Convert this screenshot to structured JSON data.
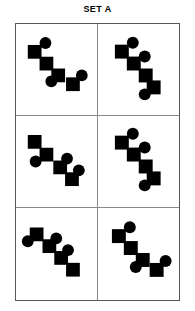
{
  "title": "SET A",
  "colors": {
    "shape_fill": "#000000",
    "background": "#ffffff",
    "outer_border": "#58585a",
    "inner_border": "#8a8a8c"
  },
  "grid": {
    "columns": 2,
    "rows": 3
  },
  "cells": [
    {
      "id": "cell-1",
      "label": "Figure 1",
      "squares": [
        {
          "x": 12,
          "y": 14,
          "size": 14
        },
        {
          "x": 24,
          "y": 26,
          "size": 14
        },
        {
          "x": 36,
          "y": 38,
          "size": 14
        },
        {
          "x": 51,
          "y": 47,
          "size": 14
        }
      ],
      "circles": [
        {
          "cx": 30,
          "cy": 12,
          "r": 6
        },
        {
          "cx": 36,
          "cy": 51,
          "r": 6
        },
        {
          "cx": 67,
          "cy": 45,
          "r": 6
        }
      ]
    },
    {
      "id": "cell-2",
      "label": "Figure 2",
      "squares": [
        {
          "x": 17,
          "y": 14,
          "size": 14
        },
        {
          "x": 29,
          "y": 26,
          "size": 14
        },
        {
          "x": 41,
          "y": 38,
          "size": 14
        },
        {
          "x": 49,
          "y": 50,
          "size": 14
        }
      ],
      "circles": [
        {
          "cx": 35,
          "cy": 12,
          "r": 6
        },
        {
          "cx": 47,
          "cy": 26,
          "r": 6
        },
        {
          "cx": 47,
          "cy": 64,
          "r": 6
        }
      ]
    },
    {
      "id": "cell-3",
      "label": "Figure 3",
      "squares": [
        {
          "x": 12,
          "y": 12,
          "size": 14
        },
        {
          "x": 24,
          "y": 25,
          "size": 14
        },
        {
          "x": 38,
          "y": 38,
          "size": 14
        },
        {
          "x": 50,
          "y": 50,
          "size": 14
        }
      ],
      "circles": [
        {
          "cx": 20,
          "cy": 39,
          "r": 6
        },
        {
          "cx": 52,
          "cy": 36,
          "r": 6
        },
        {
          "cx": 64,
          "cy": 48,
          "r": 6
        }
      ]
    },
    {
      "id": "cell-4",
      "label": "Figure 4",
      "squares": [
        {
          "x": 17,
          "y": 13,
          "size": 14
        },
        {
          "x": 29,
          "y": 25,
          "size": 14
        },
        {
          "x": 41,
          "y": 37,
          "size": 14
        },
        {
          "x": 49,
          "y": 49,
          "size": 14
        }
      ],
      "circles": [
        {
          "cx": 35,
          "cy": 11,
          "r": 6
        },
        {
          "cx": 47,
          "cy": 25,
          "r": 6
        },
        {
          "cx": 47,
          "cy": 63,
          "r": 6
        }
      ]
    },
    {
      "id": "cell-5",
      "label": "Figure 5",
      "squares": [
        {
          "x": 14,
          "y": 12,
          "size": 14
        },
        {
          "x": 27,
          "y": 24,
          "size": 14
        },
        {
          "x": 39,
          "y": 36,
          "size": 14
        },
        {
          "x": 51,
          "y": 48,
          "size": 14
        }
      ],
      "circles": [
        {
          "cx": 12,
          "cy": 26,
          "r": 6
        },
        {
          "cx": 41,
          "cy": 23,
          "r": 6
        },
        {
          "cx": 53,
          "cy": 35,
          "r": 6
        }
      ]
    },
    {
      "id": "cell-6",
      "label": "Figure 6",
      "squares": [
        {
          "x": 14,
          "y": 14,
          "size": 14
        },
        {
          "x": 26,
          "y": 26,
          "size": 14
        },
        {
          "x": 38,
          "y": 38,
          "size": 14
        },
        {
          "x": 52,
          "y": 48,
          "size": 14
        }
      ],
      "circles": [
        {
          "cx": 32,
          "cy": 12,
          "r": 6
        },
        {
          "cx": 38,
          "cy": 52,
          "r": 6
        },
        {
          "cx": 68,
          "cy": 46,
          "r": 6
        }
      ]
    }
  ]
}
